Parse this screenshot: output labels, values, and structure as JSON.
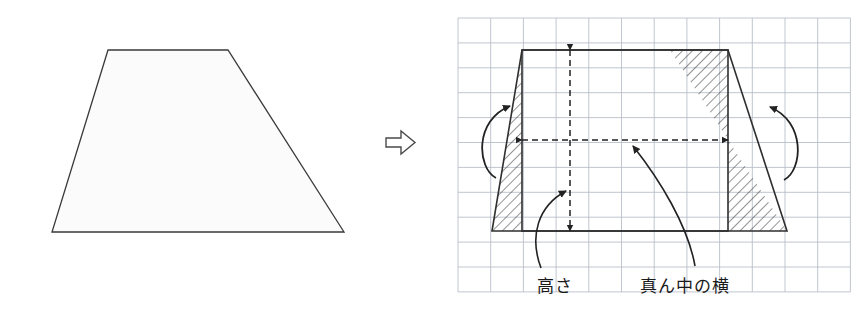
{
  "figure": {
    "title_visible": false,
    "canvas": {
      "width": 868,
      "height": 312,
      "background": "#ffffff"
    },
    "stroke_color": "#3a3a3a",
    "grid_color": "#b9bfc9",
    "hatch_color": "#333333",
    "dash_color": "#222222"
  },
  "left_shape": {
    "name": "trapezoid-outline",
    "type": "trapezoid",
    "fill": "#fbfbfb",
    "points": "108,50 228,50 344,232 52,232",
    "top_left": [
      108,
      50
    ],
    "top_right": [
      228,
      50
    ],
    "bottom_right": [
      344,
      232
    ],
    "bottom_left": [
      52,
      232
    ]
  },
  "transform_arrow": {
    "name": "block-arrow-right",
    "glyph": "right-arrow-icon",
    "x": 386,
    "y": 131
  },
  "right_shape": {
    "name": "trapezoid-on-grid",
    "grid": {
      "x0": 458,
      "y0": 18,
      "cell_w": 32.7,
      "cell_h": 24.9,
      "cols": 12,
      "rows": 11,
      "visible": true
    },
    "trapezoid_points": "522,50 728,50 787,231 492,231",
    "rectangle": {
      "left": 522,
      "top": 50,
      "right": 728,
      "bottom": 231
    },
    "hatched_left": "522,50 522,231 492,231",
    "hatched_right": "670,50 728,50 728,231 787,231",
    "height_arrow": {
      "x": 570,
      "y_top": 50,
      "y_bottom": 231,
      "style": "dashed-double"
    },
    "midwidth_arrow": {
      "y": 140,
      "x_left": 522,
      "x_right": 728,
      "style": "dashed-double"
    }
  },
  "labels": [
    {
      "id": "height-label",
      "text": "高さ",
      "x": 537,
      "y": 272
    },
    {
      "id": "midwidth-label",
      "text": "真ん中の横",
      "x": 640,
      "y": 272
    }
  ],
  "curved_arrows": [
    {
      "id": "rotate-left-arrow",
      "side": "left",
      "direction": "counterclockwise"
    },
    {
      "id": "rotate-right-arrow",
      "side": "right",
      "direction": "counterclockwise"
    }
  ]
}
